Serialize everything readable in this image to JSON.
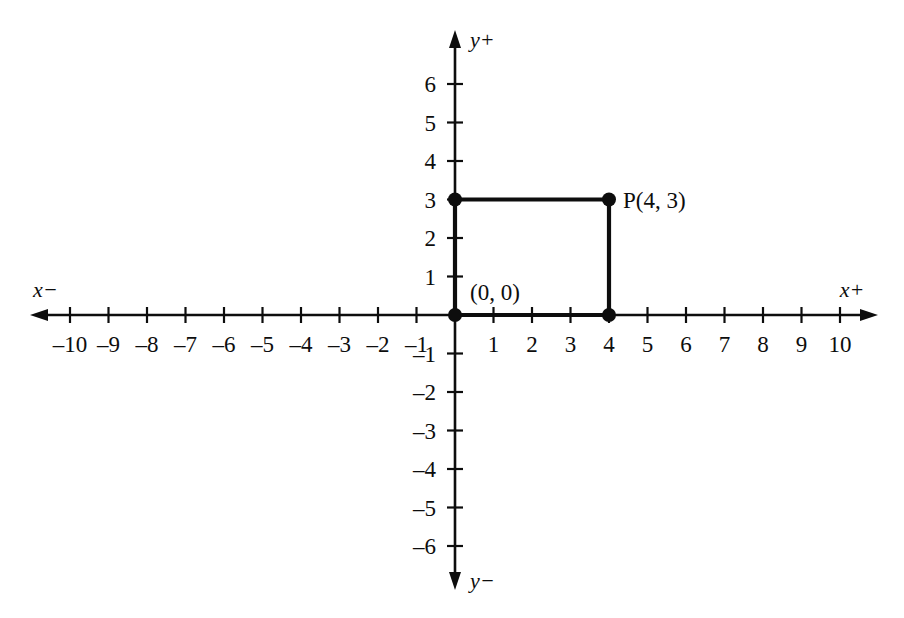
{
  "chart_data": {
    "type": "scatter",
    "title": "",
    "xlabel": "",
    "ylabel": "",
    "grid": false,
    "legend": null,
    "xlim": [
      -11,
      11
    ],
    "ylim": [
      -7,
      7
    ],
    "origin_px": {
      "x": 455,
      "y": 315
    },
    "unit_px": 38.5,
    "axis_labels": {
      "x_negative": "x−",
      "x_positive": "x+",
      "y_positive": "y+",
      "y_negative": "y−"
    },
    "x_ticks": [
      {
        "value": -10,
        "label": "–10"
      },
      {
        "value": -9,
        "label": "–9"
      },
      {
        "value": -8,
        "label": "–8"
      },
      {
        "value": -7,
        "label": "–7"
      },
      {
        "value": -6,
        "label": "–6"
      },
      {
        "value": -5,
        "label": "–5"
      },
      {
        "value": -4,
        "label": "–4"
      },
      {
        "value": -3,
        "label": "–3"
      },
      {
        "value": -2,
        "label": "–2"
      },
      {
        "value": -1,
        "label": "–1"
      },
      {
        "value": 1,
        "label": "1"
      },
      {
        "value": 2,
        "label": "2"
      },
      {
        "value": 3,
        "label": "3"
      },
      {
        "value": 4,
        "label": "4"
      },
      {
        "value": 5,
        "label": "5"
      },
      {
        "value": 6,
        "label": "6"
      },
      {
        "value": 7,
        "label": "7"
      },
      {
        "value": 8,
        "label": "8"
      },
      {
        "value": 9,
        "label": "9"
      },
      {
        "value": 10,
        "label": "10"
      }
    ],
    "y_ticks": [
      {
        "value": 6,
        "label": "6"
      },
      {
        "value": 5,
        "label": "5"
      },
      {
        "value": 4,
        "label": "4"
      },
      {
        "value": 3,
        "label": "3"
      },
      {
        "value": 2,
        "label": "2"
      },
      {
        "value": 1,
        "label": "1"
      },
      {
        "value": -1,
        "label": "–1"
      },
      {
        "value": -2,
        "label": "–2"
      },
      {
        "value": -3,
        "label": "–3"
      },
      {
        "value": -4,
        "label": "–4"
      },
      {
        "value": -5,
        "label": "–5"
      },
      {
        "value": -6,
        "label": "–6"
      }
    ],
    "points": [
      {
        "name": "origin",
        "x": 0,
        "y": 0,
        "label": "(0, 0)"
      },
      {
        "name": "corner-x-axis",
        "x": 4,
        "y": 0,
        "label": ""
      },
      {
        "name": "corner-y-axis",
        "x": 0,
        "y": 3,
        "label": ""
      },
      {
        "name": "point-p",
        "x": 4,
        "y": 3,
        "label": "P(4, 3)"
      }
    ],
    "shapes": [
      {
        "name": "rectangle-origin-to-p",
        "type": "rectangle",
        "vertices": [
          [
            0,
            0
          ],
          [
            0,
            3
          ],
          [
            4,
            3
          ],
          [
            4,
            0
          ]
        ]
      }
    ],
    "colors": {
      "ink": "#0d0d0d",
      "background": "#ffffff"
    }
  }
}
